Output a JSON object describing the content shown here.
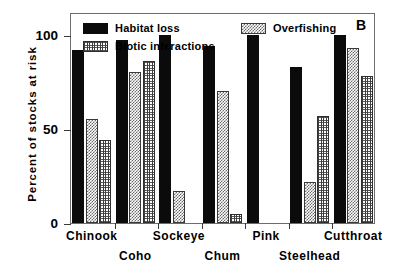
{
  "panel": {
    "letter": "B"
  },
  "axes": {
    "ylabel": "Percent of stocks at risk",
    "xlabel": "",
    "yticks": [
      "0",
      "50",
      "100"
    ]
  },
  "legend": {
    "items": [
      {
        "label": "Habitat loss",
        "pattern": "solid-black"
      },
      {
        "label": "Overfishing",
        "pattern": "light-checker"
      },
      {
        "label": "Biotic interactions",
        "pattern": "dark-crosshatch"
      }
    ]
  },
  "chart_data": {
    "type": "bar",
    "title": "",
    "subtitle": "",
    "xlabel": "",
    "ylabel": "Percent of stocks at risk",
    "ylim": [
      0,
      112
    ],
    "yticks": [
      0,
      50,
      100
    ],
    "grid": false,
    "legend_position": "top-inside",
    "annotations": [
      {
        "text": "B",
        "position": "top-right"
      }
    ],
    "categories": [
      "Chinook",
      "Coho",
      "Sockeye",
      "Chum",
      "Pink",
      "Steelhead",
      "Cutthroat"
    ],
    "series": [
      {
        "name": "Habitat loss",
        "values": [
          92,
          97,
          100,
          94,
          100,
          83,
          100
        ]
      },
      {
        "name": "Overfishing",
        "values": [
          55,
          80,
          17,
          70,
          0,
          22,
          93
        ]
      },
      {
        "name": "Biotic interactions",
        "values": [
          44,
          86,
          0,
          5,
          0,
          57,
          78
        ]
      }
    ]
  }
}
